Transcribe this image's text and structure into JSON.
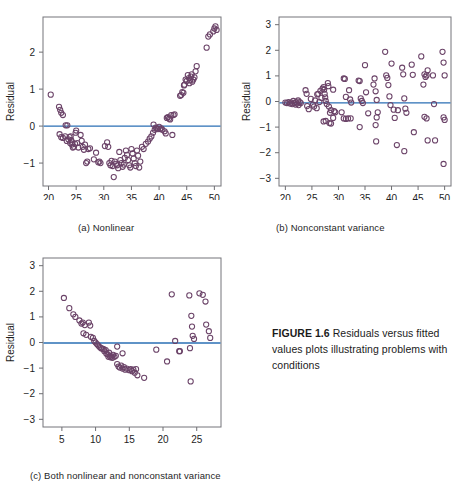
{
  "figure": {
    "label": "FIGURE 1.6",
    "caption_text": " Residuals versus fitted values plots illustrating problems with conditions"
  },
  "panels": [
    {
      "id": "a",
      "sub_caption": "(a) Nonlinear",
      "xlabel": "YHat",
      "ylabel": "Residual"
    },
    {
      "id": "b",
      "sub_caption": "(b) Nonconstant variance",
      "xlabel": "YHat",
      "ylabel": "Residual"
    },
    {
      "id": "c",
      "sub_caption": "(c) Both nonlinear and nonconstant variance",
      "xlabel": "YHat",
      "ylabel": "Residual"
    }
  ],
  "colors": {
    "point_stroke": "#6b4368",
    "reference_line": "#2a6fb5",
    "axis": "#74747a",
    "text": "#1b1b1b"
  },
  "chart_data": [
    {
      "type": "scatter",
      "id": "a",
      "title": "(a) Nonlinear",
      "xlabel": "YHat",
      "ylabel": "Residual",
      "xlim": [
        19.0,
        51.2
      ],
      "ylim": [
        -1.62,
        2.95
      ],
      "xticks": [
        20,
        25,
        30,
        35,
        40,
        45,
        50
      ],
      "yticks": [
        -1,
        0,
        1,
        2
      ],
      "grid": false,
      "legend": "none",
      "reference_line_y": 0,
      "points": [
        [
          20.4,
          0.85
        ],
        [
          21.9,
          0.52
        ],
        [
          22.1,
          0.44
        ],
        [
          22.3,
          0.36
        ],
        [
          22.6,
          0.3
        ],
        [
          22.0,
          -0.22
        ],
        [
          22.3,
          -0.3
        ],
        [
          22.6,
          -0.32
        ],
        [
          23.1,
          0.02
        ],
        [
          23.4,
          0.02
        ],
        [
          23.0,
          -0.28
        ],
        [
          23.3,
          -0.4
        ],
        [
          23.6,
          -0.36
        ],
        [
          23.8,
          -0.3
        ],
        [
          23.9,
          -0.46
        ],
        [
          24.0,
          -0.28
        ],
        [
          24.1,
          -0.38
        ],
        [
          24.2,
          -0.5
        ],
        [
          24.3,
          -0.44
        ],
        [
          24.4,
          -0.58
        ],
        [
          24.6,
          -0.56
        ],
        [
          24.8,
          -0.48
        ],
        [
          24.9,
          -0.18
        ],
        [
          25.0,
          -0.12
        ],
        [
          25.2,
          -0.46
        ],
        [
          25.4,
          -0.58
        ],
        [
          25.8,
          -0.24
        ],
        [
          26.0,
          -0.4
        ],
        [
          26.2,
          -0.56
        ],
        [
          26.4,
          -0.64
        ],
        [
          26.6,
          -0.5
        ],
        [
          26.8,
          -1.0
        ],
        [
          27.0,
          -0.96
        ],
        [
          27.2,
          -0.62
        ],
        [
          27.5,
          -0.6
        ],
        [
          28.2,
          -0.9
        ],
        [
          28.6,
          -0.72
        ],
        [
          29.0,
          -0.98
        ],
        [
          29.2,
          -0.96
        ],
        [
          29.4,
          -1.0
        ],
        [
          30.2,
          -0.54
        ],
        [
          30.6,
          -0.44
        ],
        [
          30.8,
          -0.56
        ],
        [
          31.0,
          -1.0
        ],
        [
          31.2,
          -1.06
        ],
        [
          31.4,
          -0.94
        ],
        [
          31.6,
          -1.08
        ],
        [
          31.8,
          -1.38
        ],
        [
          32.0,
          -0.96
        ],
        [
          32.2,
          -1.02
        ],
        [
          32.4,
          -1.06
        ],
        [
          32.6,
          -1.14
        ],
        [
          32.8,
          -0.7
        ],
        [
          33.0,
          -0.92
        ],
        [
          33.2,
          -1.0
        ],
        [
          33.4,
          -1.1
        ],
        [
          33.6,
          -1.04
        ],
        [
          33.8,
          -0.86
        ],
        [
          34.0,
          -0.66
        ],
        [
          34.2,
          -0.78
        ],
        [
          34.4,
          -0.92
        ],
        [
          34.6,
          -1.06
        ],
        [
          34.8,
          -1.12
        ],
        [
          35.0,
          -0.62
        ],
        [
          35.2,
          -0.74
        ],
        [
          35.4,
          -0.88
        ],
        [
          35.6,
          -1.0
        ],
        [
          35.8,
          -1.08
        ],
        [
          36.0,
          -0.66
        ],
        [
          36.2,
          -0.8
        ],
        [
          36.4,
          -1.12
        ],
        [
          36.6,
          -0.96
        ],
        [
          36.9,
          -0.56
        ],
        [
          37.2,
          -0.62
        ],
        [
          37.6,
          -0.48
        ],
        [
          38.0,
          -0.42
        ],
        [
          38.3,
          -0.34
        ],
        [
          38.6,
          -0.28
        ],
        [
          38.9,
          -0.18
        ],
        [
          39.0,
          0.04
        ],
        [
          39.2,
          -0.1
        ],
        [
          39.4,
          -0.04
        ],
        [
          39.6,
          -0.06
        ],
        [
          39.8,
          -0.08
        ],
        [
          40.0,
          -0.02
        ],
        [
          40.2,
          -0.08
        ],
        [
          40.4,
          -0.06
        ],
        [
          40.6,
          -0.1
        ],
        [
          41.0,
          -0.14
        ],
        [
          41.2,
          -0.2
        ],
        [
          41.4,
          0.22
        ],
        [
          41.6,
          0.24
        ],
        [
          41.8,
          0.2
        ],
        [
          42.0,
          0.18
        ],
        [
          42.2,
          0.3
        ],
        [
          42.4,
          -0.24
        ],
        [
          42.6,
          0.3
        ],
        [
          42.8,
          0.32
        ],
        [
          43.8,
          0.82
        ],
        [
          44.0,
          0.84
        ],
        [
          44.2,
          0.92
        ],
        [
          44.4,
          0.9
        ],
        [
          44.5,
          1.1
        ],
        [
          44.6,
          1.12
        ],
        [
          44.8,
          1.26
        ],
        [
          45.0,
          1.22
        ],
        [
          45.2,
          1.38
        ],
        [
          45.4,
          1.3
        ],
        [
          45.5,
          1.16
        ],
        [
          45.6,
          1.24
        ],
        [
          45.8,
          1.34
        ],
        [
          45.9,
          1.4
        ],
        [
          46.0,
          1.2
        ],
        [
          46.2,
          1.26
        ],
        [
          46.4,
          1.32
        ],
        [
          46.6,
          1.48
        ],
        [
          46.8,
          1.62
        ],
        [
          48.6,
          2.12
        ],
        [
          48.9,
          2.42
        ],
        [
          49.2,
          2.48
        ],
        [
          49.8,
          2.56
        ],
        [
          50.0,
          2.64
        ],
        [
          50.2,
          2.7
        ],
        [
          50.4,
          2.6
        ]
      ]
    },
    {
      "type": "scatter",
      "id": "b",
      "title": "(b) Nonconstant variance",
      "xlabel": "YHat",
      "ylabel": "Residual",
      "xlim": [
        18.8,
        51.2
      ],
      "ylim": [
        -3.3,
        3.3
      ],
      "xticks": [
        20,
        25,
        30,
        35,
        40,
        45,
        50
      ],
      "yticks": [
        -3,
        -2,
        -1,
        0,
        1,
        2,
        3
      ],
      "grid": false,
      "legend": "none",
      "reference_line_y": -0.05,
      "points": [
        [
          20.0,
          -0.04
        ],
        [
          20.3,
          -0.06
        ],
        [
          20.6,
          -0.02
        ],
        [
          20.9,
          -0.08
        ],
        [
          21.1,
          -0.04
        ],
        [
          21.3,
          -0.1
        ],
        [
          21.5,
          0.02
        ],
        [
          21.7,
          -0.06
        ],
        [
          21.9,
          -0.12
        ],
        [
          22.0,
          -0.02
        ],
        [
          22.2,
          -0.08
        ],
        [
          22.4,
          0.04
        ],
        [
          22.5,
          -0.14
        ],
        [
          22.7,
          -0.02
        ],
        [
          22.9,
          -0.06
        ],
        [
          23.8,
          0.44
        ],
        [
          24.0,
          0.3
        ],
        [
          24.1,
          -0.18
        ],
        [
          24.4,
          -0.3
        ],
        [
          24.8,
          0.1
        ],
        [
          25.2,
          -0.12
        ],
        [
          25.4,
          -0.2
        ],
        [
          25.6,
          0.04
        ],
        [
          25.9,
          -0.26
        ],
        [
          26.0,
          0.28
        ],
        [
          26.2,
          0.3
        ],
        [
          26.4,
          -0.02
        ],
        [
          26.6,
          0.42
        ],
        [
          26.8,
          0.14
        ],
        [
          27.0,
          0.5
        ],
        [
          27.2,
          0.56
        ],
        [
          27.3,
          0.46
        ],
        [
          27.4,
          0.3
        ],
        [
          27.5,
          0.16
        ],
        [
          27.6,
          0.02
        ],
        [
          27.8,
          -0.1
        ],
        [
          27.2,
          -0.78
        ],
        [
          27.6,
          -0.76
        ],
        [
          28.0,
          0.72
        ],
        [
          28.1,
          0.6
        ],
        [
          28.2,
          -0.2
        ],
        [
          28.4,
          -0.44
        ],
        [
          28.6,
          -0.34
        ],
        [
          28.3,
          -0.84
        ],
        [
          28.6,
          -0.86
        ],
        [
          29.0,
          0.46
        ],
        [
          29.2,
          -0.38
        ],
        [
          29.4,
          -0.42
        ],
        [
          29.0,
          -0.64
        ],
        [
          30.6,
          -0.42
        ],
        [
          31.0,
          0.9
        ],
        [
          31.2,
          0.88
        ],
        [
          31.4,
          0.18
        ],
        [
          31.0,
          -0.66
        ],
        [
          31.4,
          -0.68
        ],
        [
          31.8,
          -0.66
        ],
        [
          32.0,
          0.44
        ],
        [
          32.2,
          0.08
        ],
        [
          32.4,
          -0.04
        ],
        [
          32.3,
          -0.66
        ],
        [
          33.8,
          0.82
        ],
        [
          34.0,
          0.8
        ],
        [
          34.2,
          0.12
        ],
        [
          34.4,
          0.02
        ],
        [
          34.0,
          -1.0
        ],
        [
          34.6,
          -0.06
        ],
        [
          35.0,
          1.42
        ],
        [
          35.2,
          0.36
        ],
        [
          35.6,
          -0.46
        ],
        [
          36.6,
          0.66
        ],
        [
          36.8,
          0.9
        ],
        [
          37.0,
          0.4
        ],
        [
          37.2,
          0.06
        ],
        [
          37.4,
          -0.42
        ],
        [
          37.2,
          -0.62
        ],
        [
          37.0,
          -0.92
        ],
        [
          37.1,
          -1.56
        ],
        [
          38.8,
          1.94
        ],
        [
          39.0,
          1.02
        ],
        [
          39.2,
          0.92
        ],
        [
          39.4,
          0.64
        ],
        [
          39.6,
          0.2
        ],
        [
          39.8,
          -0.14
        ],
        [
          40.0,
          1.48
        ],
        [
          40.4,
          -0.32
        ],
        [
          40.6,
          -0.64
        ],
        [
          41.2,
          -0.34
        ],
        [
          41.0,
          -1.7
        ],
        [
          42.0,
          1.32
        ],
        [
          42.2,
          1.06
        ],
        [
          42.4,
          0.12
        ],
        [
          42.6,
          -0.28
        ],
        [
          42.8,
          -0.44
        ],
        [
          42.4,
          -1.94
        ],
        [
          43.8,
          1.44
        ],
        [
          44.0,
          1.04
        ],
        [
          44.2,
          -1.2
        ],
        [
          45.6,
          1.76
        ],
        [
          46.0,
          0.66
        ],
        [
          46.2,
          1.06
        ],
        [
          46.4,
          0.96
        ],
        [
          46.6,
          1.02
        ],
        [
          46.8,
          1.22
        ],
        [
          46.2,
          -0.6
        ],
        [
          46.6,
          -0.66
        ],
        [
          46.8,
          -1.52
        ],
        [
          47.8,
          1.02
        ],
        [
          48.0,
          -0.1
        ],
        [
          48.2,
          -1.52
        ],
        [
          49.6,
          1.94
        ],
        [
          49.8,
          1.52
        ],
        [
          50.0,
          1.02
        ],
        [
          49.8,
          -0.62
        ],
        [
          50.0,
          -0.72
        ],
        [
          49.8,
          -2.44
        ]
      ]
    },
    {
      "type": "scatter",
      "id": "c",
      "title": "(c) Both nonlinear and nonconstant variance",
      "xlabel": "YHat",
      "ylabel": "Residual",
      "xlim": [
        2.2,
        28.6
      ],
      "ylim": [
        -3.3,
        3.3
      ],
      "xticks": [
        5,
        10,
        15,
        20,
        25
      ],
      "yticks": [
        -3,
        -2,
        -1,
        0,
        1,
        2,
        3
      ],
      "grid": false,
      "legend": "none",
      "reference_line_y": -0.02,
      "points": [
        [
          5.3,
          1.74
        ],
        [
          6.1,
          1.34
        ],
        [
          6.7,
          1.1
        ],
        [
          7.0,
          1.0
        ],
        [
          7.6,
          0.86
        ],
        [
          7.9,
          0.74
        ],
        [
          8.1,
          0.78
        ],
        [
          8.4,
          0.68
        ],
        [
          8.2,
          0.36
        ],
        [
          8.6,
          0.3
        ],
        [
          9.0,
          0.78
        ],
        [
          9.2,
          0.66
        ],
        [
          9.3,
          0.22
        ],
        [
          9.6,
          0.18
        ],
        [
          9.8,
          0.06
        ],
        [
          10.0,
          0.0
        ],
        [
          10.2,
          -0.06
        ],
        [
          10.4,
          -0.12
        ],
        [
          10.6,
          -0.18
        ],
        [
          10.8,
          -0.22
        ],
        [
          11.0,
          -0.24
        ],
        [
          11.2,
          -0.26
        ],
        [
          11.3,
          -0.34
        ],
        [
          11.5,
          -0.3
        ],
        [
          11.6,
          -0.44
        ],
        [
          11.8,
          -0.46
        ],
        [
          11.9,
          -0.56
        ],
        [
          12.0,
          -0.4
        ],
        [
          12.1,
          -0.52
        ],
        [
          12.2,
          -0.58
        ],
        [
          12.4,
          -0.54
        ],
        [
          12.5,
          -0.6
        ],
        [
          12.6,
          -0.48
        ],
        [
          12.8,
          -0.56
        ],
        [
          13.0,
          -0.52
        ],
        [
          13.2,
          -0.16
        ],
        [
          13.2,
          -0.84
        ],
        [
          13.4,
          -0.94
        ],
        [
          13.6,
          -0.98
        ],
        [
          13.8,
          -0.9
        ],
        [
          14.0,
          -1.02
        ],
        [
          14.2,
          -0.96
        ],
        [
          14.0,
          -0.42
        ],
        [
          14.4,
          -1.06
        ],
        [
          14.6,
          -1.02
        ],
        [
          15.0,
          -1.08
        ],
        [
          15.2,
          -1.04
        ],
        [
          15.4,
          -1.12
        ],
        [
          15.6,
          -1.06
        ],
        [
          15.8,
          -1.18
        ],
        [
          16.0,
          -1.04
        ],
        [
          16.2,
          -1.28
        ],
        [
          17.2,
          -1.38
        ],
        [
          19.0,
          -0.28
        ],
        [
          20.6,
          -0.74
        ],
        [
          21.3,
          1.88
        ],
        [
          21.8,
          0.06
        ],
        [
          22.4,
          -0.34
        ],
        [
          22.5,
          -0.34
        ],
        [
          23.9,
          1.84
        ],
        [
          24.2,
          1.04
        ],
        [
          24.3,
          0.62
        ],
        [
          24.4,
          0.26
        ],
        [
          24.6,
          0.14
        ],
        [
          24.0,
          -0.22
        ],
        [
          24.1,
          -1.52
        ],
        [
          25.4,
          1.92
        ],
        [
          26.3,
          1.6
        ],
        [
          26.4,
          0.7
        ],
        [
          26.8,
          0.44
        ],
        [
          27.0,
          0.18
        ],
        [
          25.9,
          1.86
        ]
      ]
    }
  ]
}
